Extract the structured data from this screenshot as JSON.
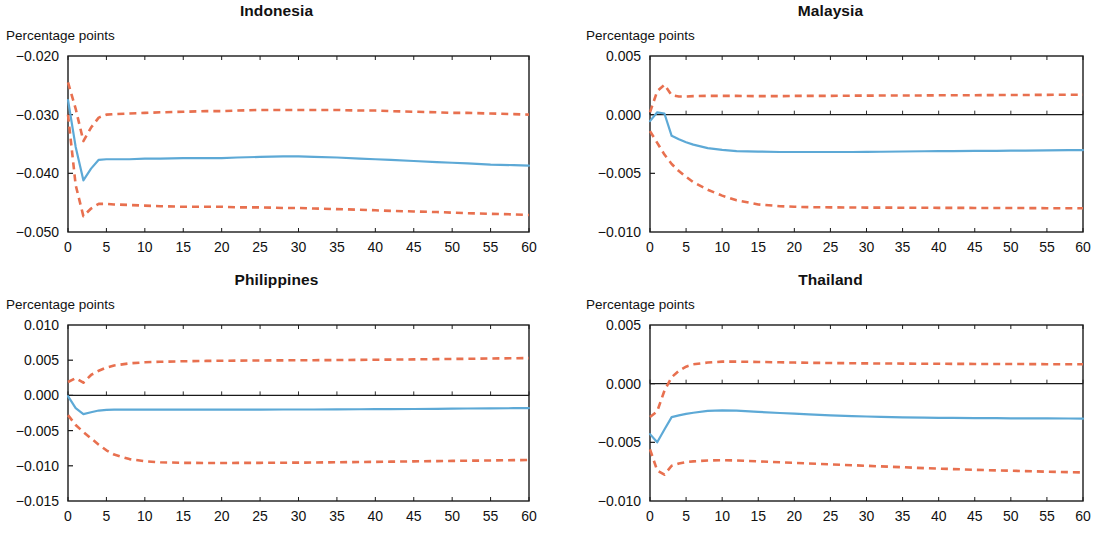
{
  "figure": {
    "panel_count": 4,
    "axis_unit_label": "Percentage points",
    "colors": {
      "median_line": "#5DA9D6",
      "confidence_band": "#E8704F",
      "axis": "#1a1a1a",
      "zero_line": "#1a1a1a",
      "background": "#ffffff"
    }
  },
  "chart_data": [
    {
      "type": "line",
      "title": "Indonesia",
      "xlabel": "",
      "ylabel": "Percentage points",
      "xlim": [
        0,
        60
      ],
      "ylim": [
        -0.05,
        -0.02
      ],
      "xticks": [
        0,
        5,
        10,
        15,
        20,
        25,
        30,
        35,
        40,
        45,
        50,
        55,
        60
      ],
      "yticks": [
        -0.02,
        -0.03,
        -0.04,
        -0.05
      ],
      "ytick_labels": [
        "-0.020",
        "-0.030",
        "-0.040",
        "-0.050"
      ],
      "grid": false,
      "legend": "none",
      "zero_line": false,
      "x": [
        0,
        1,
        2,
        3,
        4,
        5,
        6,
        8,
        10,
        12,
        15,
        18,
        20,
        22,
        25,
        28,
        30,
        32,
        35,
        38,
        40,
        42,
        45,
        48,
        50,
        52,
        55,
        58,
        60
      ],
      "series": [
        {
          "name": "Median impulse response",
          "style": "solid",
          "color": "#5DA9D6",
          "values": [
            -0.0275,
            -0.0355,
            -0.0412,
            -0.0392,
            -0.0377,
            -0.0376,
            -0.0376,
            -0.0376,
            -0.0375,
            -0.0375,
            -0.0374,
            -0.0374,
            -0.0374,
            -0.0373,
            -0.0372,
            -0.0371,
            -0.0371,
            -0.0372,
            -0.0373,
            -0.0375,
            -0.0376,
            -0.0377,
            -0.0379,
            -0.0381,
            -0.0382,
            -0.0383,
            -0.0385,
            -0.0386,
            -0.0387
          ]
        },
        {
          "name": "Upper confidence bound",
          "style": "dashed",
          "color": "#E8704F",
          "values": [
            -0.0245,
            -0.029,
            -0.0345,
            -0.0322,
            -0.0305,
            -0.03,
            -0.0299,
            -0.0298,
            -0.0297,
            -0.0296,
            -0.0295,
            -0.0294,
            -0.0294,
            -0.0293,
            -0.0292,
            -0.0292,
            -0.0292,
            -0.0292,
            -0.0292,
            -0.0293,
            -0.0293,
            -0.0294,
            -0.0295,
            -0.0296,
            -0.0297,
            -0.0297,
            -0.0298,
            -0.0299,
            -0.03
          ]
        },
        {
          "name": "Lower confidence bound",
          "style": "dashed",
          "color": "#E8704F",
          "values": [
            -0.03,
            -0.042,
            -0.0473,
            -0.046,
            -0.0452,
            -0.0452,
            -0.0453,
            -0.0454,
            -0.0455,
            -0.0456,
            -0.0457,
            -0.0457,
            -0.0457,
            -0.0458,
            -0.0458,
            -0.0459,
            -0.0459,
            -0.046,
            -0.0461,
            -0.0462,
            -0.0463,
            -0.0464,
            -0.0465,
            -0.0466,
            -0.0467,
            -0.0468,
            -0.0469,
            -0.047,
            -0.0471
          ]
        }
      ]
    },
    {
      "type": "line",
      "title": "Malaysia",
      "xlabel": "",
      "ylabel": "Percentage points",
      "xlim": [
        0,
        60
      ],
      "ylim": [
        -0.01,
        0.005
      ],
      "xticks": [
        0,
        5,
        10,
        15,
        20,
        25,
        30,
        35,
        40,
        45,
        50,
        55,
        60
      ],
      "yticks": [
        0.005,
        0.0,
        -0.005,
        -0.01
      ],
      "ytick_labels": [
        "0.005",
        "0.000",
        "-0.005",
        "-0.010"
      ],
      "grid": false,
      "legend": "none",
      "zero_line": true,
      "x": [
        0,
        1,
        2,
        3,
        4,
        5,
        6,
        8,
        10,
        12,
        15,
        18,
        20,
        22,
        25,
        28,
        30,
        32,
        35,
        38,
        40,
        42,
        45,
        48,
        50,
        52,
        55,
        58,
        60
      ],
      "series": [
        {
          "name": "Median impulse response",
          "style": "solid",
          "color": "#5DA9D6",
          "values": [
            -0.00055,
            0.0002,
            0.0001,
            -0.0018,
            -0.0021,
            -0.00235,
            -0.00255,
            -0.00285,
            -0.003,
            -0.0031,
            -0.00315,
            -0.00318,
            -0.00318,
            -0.00318,
            -0.00318,
            -0.00318,
            -0.00317,
            -0.00316,
            -0.00314,
            -0.00312,
            -0.00311,
            -0.0031,
            -0.00309,
            -0.00308,
            -0.00307,
            -0.00306,
            -0.00305,
            -0.00303,
            -0.00302
          ]
        },
        {
          "name": "Upper confidence bound",
          "style": "dashed",
          "color": "#E8704F",
          "values": [
            0.0002,
            0.002,
            0.00255,
            0.00165,
            0.00155,
            0.00155,
            0.00158,
            0.0016,
            0.0016,
            0.0016,
            0.00158,
            0.00158,
            0.0016,
            0.0016,
            0.0016,
            0.00162,
            0.00162,
            0.00163,
            0.00163,
            0.00164,
            0.00165,
            0.00165,
            0.00166,
            0.00167,
            0.00167,
            0.00168,
            0.00169,
            0.0017,
            0.0017
          ]
        },
        {
          "name": "Lower confidence bound",
          "style": "dashed",
          "color": "#E8704F",
          "values": [
            -0.0014,
            -0.0024,
            -0.0034,
            -0.0042,
            -0.0048,
            -0.0053,
            -0.00575,
            -0.0064,
            -0.0069,
            -0.0073,
            -0.00765,
            -0.0078,
            -0.00785,
            -0.00788,
            -0.0079,
            -0.00791,
            -0.00792,
            -0.00792,
            -0.00793,
            -0.00793,
            -0.00794,
            -0.00794,
            -0.00795,
            -0.00795,
            -0.00796,
            -0.00796,
            -0.00797,
            -0.00798,
            -0.00798
          ]
        }
      ]
    },
    {
      "type": "line",
      "title": "Philippines",
      "xlabel": "",
      "ylabel": "Percentage points",
      "xlim": [
        0,
        60
      ],
      "ylim": [
        -0.015,
        0.01
      ],
      "xticks": [
        0,
        5,
        10,
        15,
        20,
        25,
        30,
        35,
        40,
        45,
        50,
        55,
        60
      ],
      "yticks": [
        0.01,
        0.005,
        0.0,
        -0.005,
        -0.01,
        -0.015
      ],
      "ytick_labels": [
        "0.010",
        "0.005",
        "0.000",
        "-0.005",
        "-0.010",
        "-0.015"
      ],
      "grid": false,
      "legend": "none",
      "zero_line": true,
      "x": [
        0,
        1,
        2,
        3,
        4,
        5,
        6,
        8,
        10,
        12,
        15,
        18,
        20,
        22,
        25,
        28,
        30,
        32,
        35,
        38,
        40,
        42,
        45,
        48,
        50,
        52,
        55,
        58,
        60
      ],
      "series": [
        {
          "name": "Median impulse response",
          "style": "solid",
          "color": "#5DA9D6",
          "values": [
            -0.0001,
            -0.0018,
            -0.00265,
            -0.0024,
            -0.00215,
            -0.00205,
            -0.00203,
            -0.00202,
            -0.00202,
            -0.00202,
            -0.00202,
            -0.00202,
            -0.00202,
            -0.00201,
            -0.00201,
            -0.002,
            -0.002,
            -0.002,
            -0.00199,
            -0.00197,
            -0.00196,
            -0.00195,
            -0.00193,
            -0.0019,
            -0.00188,
            -0.00186,
            -0.00184,
            -0.00182,
            -0.0018
          ]
        },
        {
          "name": "Upper confidence bound",
          "style": "dashed",
          "color": "#E8704F",
          "values": [
            0.0019,
            0.00245,
            0.0018,
            0.0029,
            0.0035,
            0.00395,
            0.00425,
            0.00455,
            0.0047,
            0.00478,
            0.00485,
            0.0049,
            0.00492,
            0.00494,
            0.00496,
            0.00498,
            0.00499,
            0.005,
            0.00502,
            0.00505,
            0.00507,
            0.00508,
            0.00512,
            0.00515,
            0.00518,
            0.0052,
            0.00524,
            0.00528,
            0.0053
          ]
        },
        {
          "name": "Lower confidence bound",
          "style": "dashed",
          "color": "#E8704F",
          "values": [
            -0.0028,
            -0.0042,
            -0.0052,
            -0.0061,
            -0.007,
            -0.0078,
            -0.0084,
            -0.00905,
            -0.00935,
            -0.0095,
            -0.00958,
            -0.0096,
            -0.0096,
            -0.00959,
            -0.00958,
            -0.00956,
            -0.00955,
            -0.00953,
            -0.0095,
            -0.00946,
            -0.00944,
            -0.00941,
            -0.00937,
            -0.00933,
            -0.0093,
            -0.00928,
            -0.00924,
            -0.0092,
            -0.00918
          ]
        }
      ]
    },
    {
      "type": "line",
      "title": "Thailand",
      "xlabel": "",
      "ylabel": "Percentage points",
      "xlim": [
        0,
        60
      ],
      "ylim": [
        -0.01,
        0.005
      ],
      "xticks": [
        0,
        5,
        10,
        15,
        20,
        25,
        30,
        35,
        40,
        45,
        50,
        55,
        60
      ],
      "yticks": [
        0.005,
        0.0,
        -0.005,
        -0.01
      ],
      "ytick_labels": [
        "0.005",
        "0.000",
        "-0.005",
        "-0.010"
      ],
      "grid": false,
      "legend": "none",
      "zero_line": true,
      "x": [
        0,
        1,
        2,
        3,
        4,
        5,
        6,
        8,
        10,
        12,
        15,
        18,
        20,
        22,
        25,
        28,
        30,
        32,
        35,
        38,
        40,
        42,
        45,
        48,
        50,
        52,
        55,
        58,
        60
      ],
      "series": [
        {
          "name": "Median impulse response",
          "style": "solid",
          "color": "#5DA9D6",
          "values": [
            -0.0043,
            -0.005,
            -0.0039,
            -0.00285,
            -0.0027,
            -0.00258,
            -0.00248,
            -0.00232,
            -0.00228,
            -0.0023,
            -0.0024,
            -0.0025,
            -0.00256,
            -0.00262,
            -0.0027,
            -0.00277,
            -0.0028,
            -0.00283,
            -0.00287,
            -0.0029,
            -0.00291,
            -0.00292,
            -0.00293,
            -0.00294,
            -0.00295,
            -0.00295,
            -0.00296,
            -0.00297,
            -0.00298
          ]
        },
        {
          "name": "Upper confidence bound",
          "style": "dashed",
          "color": "#E8704F",
          "values": [
            -0.00285,
            -0.00235,
            -0.0006,
            0.00055,
            0.0011,
            0.00145,
            0.00165,
            0.0018,
            0.00188,
            0.00188,
            0.00185,
            0.00182,
            0.0018,
            0.00178,
            0.00176,
            0.00174,
            0.00173,
            0.00172,
            0.00171,
            0.0017,
            0.0017,
            0.00169,
            0.00168,
            0.00168,
            0.00167,
            0.00167,
            0.00166,
            0.00166,
            0.00165
          ]
        },
        {
          "name": "Lower confidence bound",
          "style": "dashed",
          "color": "#E8704F",
          "values": [
            -0.0056,
            -0.0074,
            -0.00775,
            -0.007,
            -0.0068,
            -0.00668,
            -0.00662,
            -0.00655,
            -0.00652,
            -0.00655,
            -0.00662,
            -0.0067,
            -0.00675,
            -0.0068,
            -0.00688,
            -0.00695,
            -0.007,
            -0.00705,
            -0.00712,
            -0.0072,
            -0.00724,
            -0.00728,
            -0.00734,
            -0.00739,
            -0.00742,
            -0.00745,
            -0.0075,
            -0.00754,
            -0.00757
          ]
        }
      ]
    }
  ]
}
